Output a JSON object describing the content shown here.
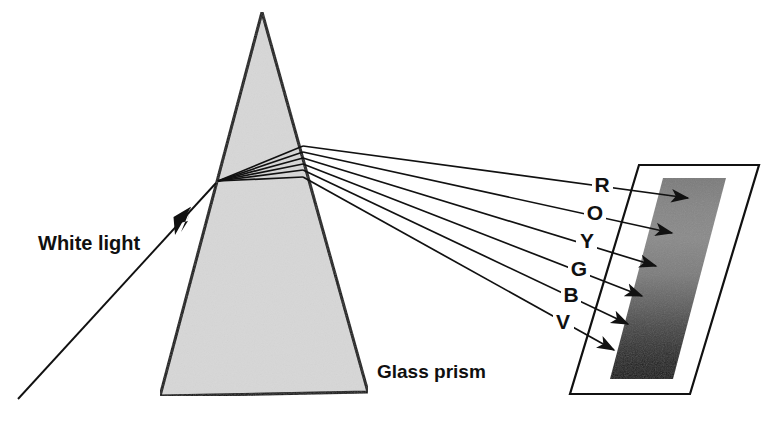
{
  "figure": {
    "background_color": "#ffffff",
    "width": 782,
    "height": 429
  },
  "labels": {
    "white_light": "White light",
    "glass_prism": "Glass prism"
  },
  "spectrum": {
    "letters": [
      "R",
      "O",
      "Y",
      "G",
      "B",
      "V"
    ],
    "names": [
      "Red",
      "Orange",
      "Yellow",
      "Green",
      "Blue",
      "Violet"
    ],
    "count": 6
  },
  "colors": {
    "prism_fill": "#d7d7d7",
    "prism_stroke": "#111111",
    "screen_fill": "#ffffff",
    "screen_stroke": "#111111",
    "band_top": "#7d7d7d",
    "band_bottom": "#121212",
    "ray_stroke": "#111111",
    "text": "#101010"
  },
  "geometry": {
    "prism": {
      "apex": [
        262,
        12
      ],
      "base_left": [
        160,
        396
      ],
      "base_right": [
        368,
        392
      ],
      "entry_point": [
        218,
        181
      ]
    },
    "incident_ray": {
      "start": [
        18,
        399
      ],
      "end": [
        218,
        181
      ]
    },
    "screen": {
      "top_left": [
        639,
        165
      ],
      "top_right": [
        759,
        165
      ],
      "bottom_right": [
        690,
        394
      ],
      "bottom_left": [
        570,
        394
      ]
    },
    "band": {
      "top_left": [
        663,
        178
      ],
      "top_right": [
        726,
        178
      ],
      "bottom_right": [
        673,
        379
      ],
      "bottom_left": [
        610,
        379
      ]
    },
    "exit_points": [
      [
        303,
        146
      ],
      [
        303,
        152
      ],
      [
        303,
        158
      ],
      [
        303,
        164
      ],
      [
        303,
        170
      ],
      [
        303,
        177
      ]
    ],
    "arrow_tips": [
      [
        688,
        198
      ],
      [
        672,
        233
      ],
      [
        656,
        267
      ],
      [
        642,
        296
      ],
      [
        628,
        324
      ],
      [
        614,
        350
      ]
    ],
    "letter_anchors": [
      [
        601,
        192
      ],
      [
        594,
        220
      ],
      [
        586,
        248
      ],
      [
        578,
        276
      ],
      [
        570,
        302
      ],
      [
        562,
        329
      ]
    ]
  }
}
